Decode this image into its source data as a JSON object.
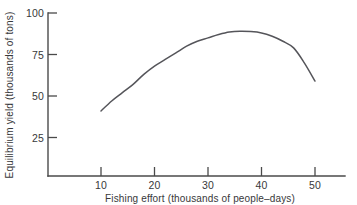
{
  "chart_data": {
    "type": "line",
    "title": "",
    "xlabel": "Fishing effort  (thousands of people–days)",
    "ylabel": "Equilibrium yield  (thousands of tons)",
    "xlim": [
      0,
      55
    ],
    "ylim": [
      0,
      100
    ],
    "xticks": [
      10,
      20,
      30,
      40,
      50
    ],
    "xtick_labels": [
      "10",
      "20",
      "30",
      "40",
      "50"
    ],
    "yticks": [
      25,
      50,
      75,
      100
    ],
    "ytick_labels": [
      "25",
      "50",
      "75",
      "100"
    ],
    "grid": false,
    "legend": "none",
    "series": [
      {
        "name": "Equilibrium yield",
        "x": [
          10,
          12,
          14,
          16,
          18,
          20,
          22,
          24,
          26,
          28,
          30,
          32,
          34,
          36,
          38,
          40,
          42,
          44,
          46,
          48,
          50
        ],
        "values": [
          41,
          47,
          52,
          57,
          63,
          68,
          72,
          76,
          80,
          83,
          85,
          87,
          88.5,
          89,
          88.8,
          88,
          86,
          83,
          79,
          70,
          59
        ]
      }
    ],
    "annotations": [
      {
        "label": "peak",
        "x": 36,
        "y": 89
      },
      {
        "label": "curve-start",
        "x": 10,
        "y": 41
      },
      {
        "label": "curve-end",
        "x": 50,
        "y": 59
      }
    ],
    "colors": {
      "curve": "#55555a",
      "axis": "#4a4a4a",
      "text": "#38383a",
      "background": "#ffffff"
    }
  },
  "axes": {
    "y_title": "Equilibrium yield  (thousands of tons)",
    "x_title": "Fishing effort  (thousands of people–days)",
    "y_tick_labels": [
      "100",
      "75",
      "50",
      "25"
    ],
    "x_tick_labels": [
      "10",
      "20",
      "30",
      "40",
      "50"
    ]
  }
}
